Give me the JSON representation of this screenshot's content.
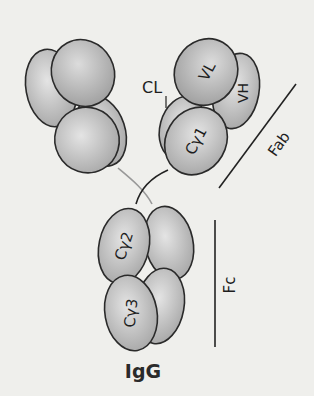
{
  "diagram": {
    "title": "IgG",
    "domains": {
      "vl": "VL",
      "vh": "VH",
      "cl": "CL",
      "ch1": "Cγ1",
      "ch2": "Cγ2",
      "ch3": "Cγ3"
    },
    "regions": {
      "fab": "Fab",
      "fc": "Fc"
    },
    "colors": {
      "background": "#efefec",
      "domain_fill_light": "#e2e2e2",
      "domain_fill_dark": "#a8a8a8",
      "outline": "#2a2a2a",
      "hinge_light": "#9a9a9a"
    }
  }
}
